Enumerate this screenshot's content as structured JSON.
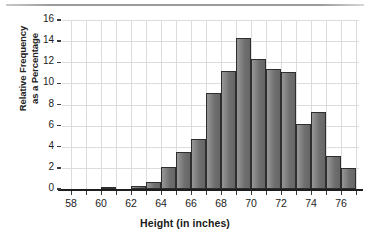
{
  "chart_data": {
    "type": "bar",
    "title": "",
    "xlabel": "Height (in inches)",
    "ylabel": "Relative Frequency as a Percentage",
    "ylabel_lines": [
      "Relative Frequency",
      "as a Percentage"
    ],
    "categories": [
      "58",
      "59",
      "60",
      "61",
      "62",
      "63",
      "64",
      "65",
      "66",
      "67",
      "68",
      "69",
      "70",
      "71",
      "72",
      "73",
      "74",
      "75",
      "76"
    ],
    "bin_width": 1,
    "bin_edges": [
      58,
      59,
      60,
      61,
      62,
      63,
      64,
      65,
      66,
      67,
      68,
      69,
      70,
      71,
      72,
      73,
      74,
      75,
      76,
      77
    ],
    "values": [
      0,
      0,
      0.15,
      0,
      0.3,
      0.7,
      2.05,
      3.5,
      4.75,
      9.05,
      11.15,
      14.25,
      12.35,
      11.35,
      11.05,
      6.2,
      7.25,
      3.15,
      2.0
    ],
    "ylim": [
      0,
      16
    ],
    "xlim": [
      57.4,
      77.2
    ],
    "yticks": [
      0,
      2,
      4,
      6,
      8,
      10,
      12,
      14,
      16
    ],
    "ytick_labels": [
      "0",
      "2",
      "4",
      "6",
      "8",
      "10",
      "12",
      "14",
      "16"
    ],
    "xticks": [
      58,
      59,
      60,
      61,
      62,
      63,
      64,
      65,
      66,
      67,
      68,
      69,
      70,
      71,
      72,
      73,
      74,
      75,
      76,
      77
    ],
    "xtick_labels_shown": [
      "58",
      "60",
      "62",
      "64",
      "66",
      "68",
      "70",
      "72",
      "74",
      "76"
    ],
    "xtick_labels_shown_values": [
      58,
      60,
      62,
      64,
      66,
      68,
      70,
      72,
      74,
      76
    ],
    "grid": true,
    "legend": null,
    "bar_color": "#7a7a7a",
    "bar_edge_color": "#2e2e2e",
    "grid_color": "#dcdcdc",
    "axis_color": "#1e1e1e"
  }
}
